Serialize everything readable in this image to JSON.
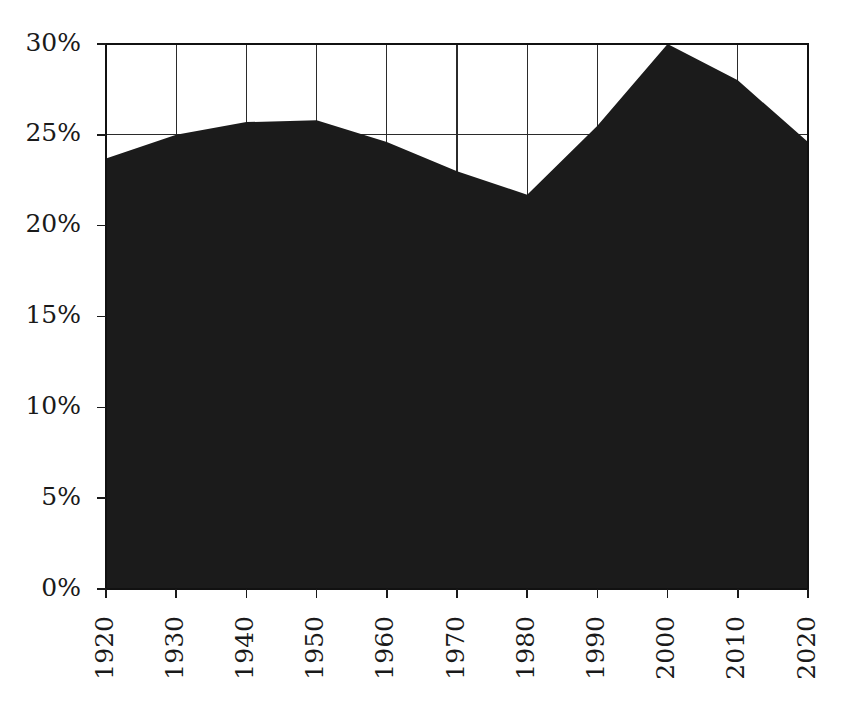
{
  "chart_data": {
    "type": "area",
    "title": "",
    "subtitle": "",
    "xlabel": "",
    "ylabel": "",
    "x": [
      1920,
      1930,
      1940,
      1950,
      1960,
      1970,
      1980,
      1990,
      2000,
      2010,
      2020
    ],
    "values": [
      23.7,
      25.0,
      25.7,
      25.8,
      24.6,
      23.0,
      21.7,
      25.5,
      30.0,
      28.0,
      24.6
    ],
    "series": [
      {
        "name": "share",
        "values": [
          23.7,
          25.0,
          25.7,
          25.8,
          24.6,
          23.0,
          21.7,
          25.5,
          30.0,
          28.0,
          24.6
        ]
      }
    ],
    "xlim": [
      1920,
      2020
    ],
    "ylim": [
      0,
      30
    ],
    "x_tick_labels": [
      "1920",
      "1930",
      "1940",
      "1950",
      "1960",
      "1970",
      "1980",
      "1990",
      "2000",
      "2010",
      "2020"
    ],
    "y_tick_values": [
      0,
      5,
      10,
      15,
      20,
      25,
      30
    ],
    "y_tick_labels": [
      "0%",
      "5%",
      "10%",
      "15%",
      "20%",
      "25%",
      "30%"
    ],
    "grid": true,
    "grid_axis": "both",
    "legend": false,
    "legend_position": "none",
    "annotations": [],
    "area_color": "#1b1b1b",
    "grid_color": "#2b2b2b",
    "axis_color": "#111111",
    "background_color": "#ffffff",
    "x_tick_label_rotation": 90
  },
  "layout": {
    "plot_left": 106,
    "plot_right": 808,
    "plot_top": 44,
    "plot_bottom": 589,
    "tick_length": 9,
    "x_label_offset": 18,
    "y_label_offset": 16
  }
}
